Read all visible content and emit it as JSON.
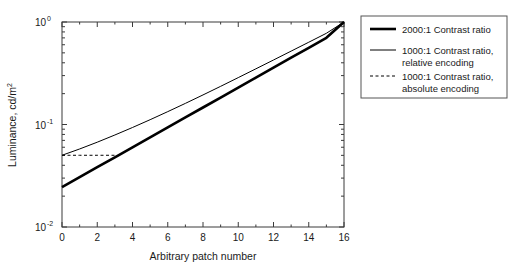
{
  "chart_data": {
    "type": "line",
    "title": "",
    "xlabel": "Arbitrary patch number",
    "ylabel": "Luminance, cd/m2",
    "ylabel_display": "Luminance, cd/m",
    "ylabel_exponent": "2",
    "xlim": [
      0,
      16
    ],
    "ylim": [
      0.01,
      1.0
    ],
    "yscale": "log",
    "xscale": "linear",
    "grid": false,
    "legend_position": "right-outside",
    "xticks": [
      0,
      2,
      4,
      6,
      8,
      10,
      12,
      14,
      16
    ],
    "xtick_labels": [
      "0",
      "2",
      "4",
      "6",
      "8",
      "10",
      "12",
      "14",
      "16"
    ],
    "yticks": [
      0.01,
      0.1,
      1.0
    ],
    "ytick_labels": [
      "10-2",
      "10-1",
      "100"
    ],
    "ytick_mantissa": [
      "10",
      "10",
      "10"
    ],
    "ytick_exponents": [
      "-2",
      "-1",
      "0"
    ],
    "series": [
      {
        "name": "2000:1 Contrast ratio",
        "style": "thick-solid",
        "color": "#000000",
        "width": 2.6,
        "dash": "none",
        "x": [
          0,
          1,
          2,
          3,
          4,
          5,
          6,
          7,
          8,
          9,
          10,
          11,
          12,
          13,
          14,
          15,
          16
        ],
        "y": [
          0.0245,
          0.0306,
          0.0383,
          0.0479,
          0.0599,
          0.0749,
          0.0937,
          0.1172,
          0.1465,
          0.1832,
          0.2291,
          0.2865,
          0.3583,
          0.4481,
          0.5604,
          0.7007,
          0.9999
        ]
      },
      {
        "name": "1000:1 Contrast ratio, relative encoding",
        "style": "thin-solid",
        "color": "#000000",
        "width": 1.0,
        "dash": "none",
        "x": [
          0,
          1,
          2,
          3,
          4,
          5,
          6,
          7,
          8,
          9,
          10,
          11,
          12,
          13,
          14,
          15,
          16
        ],
        "y": [
          0.0501,
          0.0577,
          0.0672,
          0.079,
          0.0935,
          0.1114,
          0.1335,
          0.1607,
          0.1943,
          0.2357,
          0.2868,
          0.3493,
          0.426,
          0.52,
          0.635,
          0.776,
          0.9999
        ]
      },
      {
        "name": "1000:1 Contrast ratio, absolute encoding",
        "style": "dashed",
        "color": "#000000",
        "width": 1.0,
        "dash": "3,2.5",
        "x": [
          0,
          1,
          2,
          3
        ],
        "y": [
          0.0501,
          0.0501,
          0.0501,
          0.0501
        ]
      }
    ],
    "legend_entries": [
      {
        "label_line1": "2000:1 Contrast ratio",
        "label_line2": "",
        "style": "thick-solid"
      },
      {
        "label_line1": "1000:1 Contrast ratio,",
        "label_line2": "relative encoding",
        "style": "thin-solid"
      },
      {
        "label_line1": "1000:1 Contrast ratio,",
        "label_line2": "absolute encoding",
        "style": "dashed"
      }
    ]
  }
}
